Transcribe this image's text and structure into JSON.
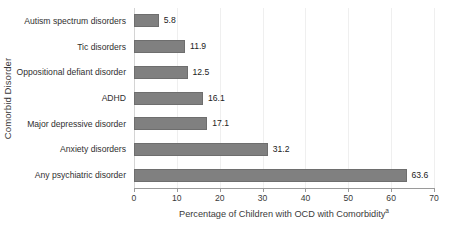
{
  "chart_data": {
    "type": "bar",
    "orientation": "horizontal",
    "title": "",
    "xlabel": "Percentage of Children with OCD with Comorbidity",
    "xlabel_superscript": "a",
    "ylabel": "Comorbid Disorder",
    "categories": [
      "Autism spectrum disorders",
      "Tic disorders",
      "Oppositional defiant disorder",
      "ADHD",
      "Major depressive disorder",
      "Anxiety disorders",
      "Any psychiatric disorder"
    ],
    "values": [
      5.8,
      11.9,
      12.5,
      16.1,
      17.1,
      31.2,
      63.6
    ],
    "value_labels": [
      "5.8",
      "11.9",
      "12.5",
      "16.1",
      "17.1",
      "31.2",
      "63.6"
    ],
    "xlim": [
      0,
      70
    ],
    "xticks": [
      0,
      10,
      20,
      30,
      40,
      50,
      60,
      70
    ],
    "xtick_labels": [
      "0",
      "10",
      "20",
      "30",
      "40",
      "50",
      "60",
      "70"
    ],
    "grid": "vertical-light",
    "legend": "none",
    "bar_color": "#808080",
    "bar_border_color": "#6e6e6e",
    "gridline_color": "#efefef",
    "axis_color": "#9a9a9a",
    "text_color": "#3a3a3a",
    "background": "#ffffff"
  }
}
